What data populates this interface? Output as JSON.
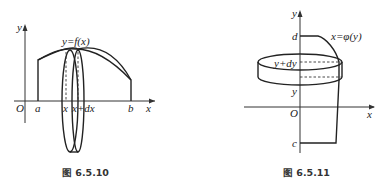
{
  "figures": [
    {
      "id": "fig-6-5-10",
      "caption": "图 6.5.10",
      "curve_label": "y=f(x)",
      "axis_labels": {
        "x": "x",
        "y": "y",
        "origin": "O"
      },
      "tick_labels": {
        "a": "a",
        "x": "x",
        "x_plus_dx": "x+dx",
        "b": "b"
      }
    },
    {
      "id": "fig-6-5-11",
      "caption": "图 6.5.11",
      "curve_label": "x=φ(y)",
      "axis_labels": {
        "x": "x",
        "y": "y",
        "origin": "O"
      },
      "tick_labels": {
        "d": "d",
        "y_plus_dy": "y+dy",
        "y": "y",
        "c": "c"
      }
    }
  ],
  "colors": {
    "line": "#222222",
    "background": "#ffffff"
  }
}
